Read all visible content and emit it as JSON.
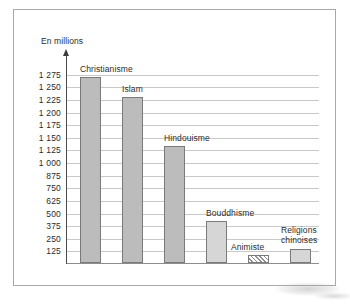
{
  "chart_data": {
    "type": "bar",
    "title": "",
    "subtitle": "",
    "xlabel": "",
    "ylabel": "En millions",
    "axis_unit_label": "En millions",
    "categories": [
      "Christianisme",
      "Islam",
      "Hindouisme",
      "Bouddhisme",
      "Animiste",
      "Religions chinoises"
    ],
    "values": [
      1260,
      1130,
      810,
      325,
      100,
      140
    ],
    "tick_labels": [
      "1 275",
      "1 250",
      "1 225",
      "1 200",
      "1 175",
      "1 150",
      "1 125",
      "1 000",
      "875",
      "750",
      "625",
      "500",
      "375",
      "250",
      "125"
    ],
    "tick_values": [
      1275,
      1250,
      1225,
      1200,
      1175,
      1150,
      1125,
      1000,
      875,
      750,
      625,
      500,
      375,
      250,
      125
    ],
    "ylim": [
      0,
      1275
    ],
    "grid": true,
    "legend": "none",
    "bar_styles": [
      "solid-dark",
      "solid-dark",
      "solid-dark",
      "solid-light",
      "hatched",
      "solid-light"
    ],
    "colors": {
      "bar_dark": "#bcbcbc",
      "bar_light": "#d6d6d6",
      "bar_border": "#7a7a7a",
      "gridline": "#c9c9c9",
      "axis": "#4a4a4a",
      "frame": "#a8a8a8",
      "text": "#2b2b2b",
      "background": "#ffffff"
    }
  }
}
